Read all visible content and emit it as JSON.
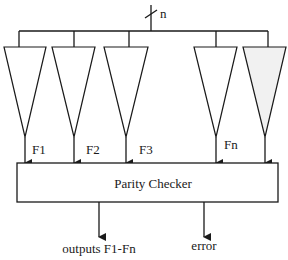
{
  "diagram": {
    "bus_label": "n",
    "function_blocks": [
      {
        "id": "F1",
        "label": "F1",
        "fill": "#ffffff"
      },
      {
        "id": "F2",
        "label": "F2",
        "fill": "#ffffff"
      },
      {
        "id": "F3",
        "label": "F3",
        "fill": "#ffffff"
      },
      {
        "id": "Fn",
        "label": "Fn",
        "fill": "#ffffff"
      },
      {
        "id": "spare",
        "label": "",
        "fill": "#f1f1f1"
      }
    ],
    "checker": {
      "label": "Parity Checker"
    },
    "outputs": [
      {
        "label": "outputs F1-Fn"
      },
      {
        "label": "error"
      }
    ]
  }
}
